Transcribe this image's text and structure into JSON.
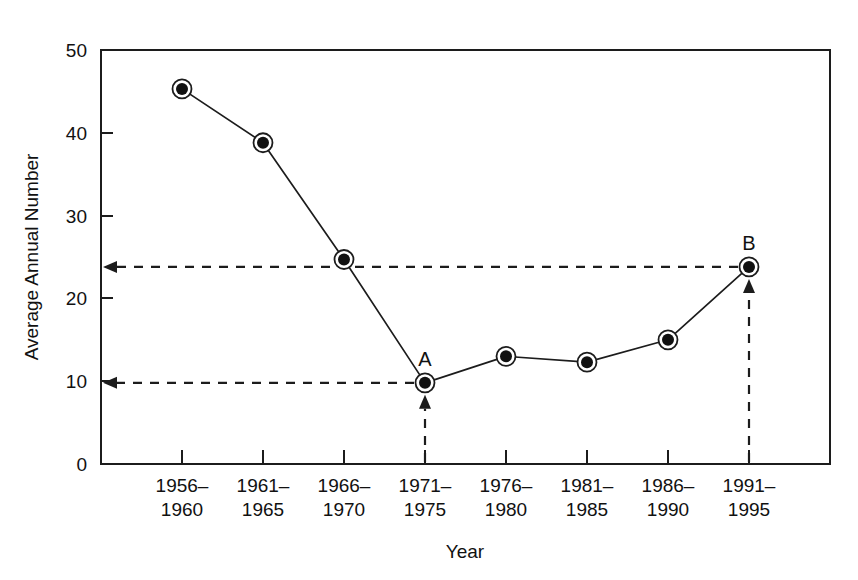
{
  "chart_data": {
    "type": "line",
    "title": "",
    "xlabel": "Year",
    "ylabel": "Average Annual Number",
    "categories": [
      "1956–1960",
      "1961–1965",
      "1966–1970",
      "1971–1975",
      "1976–1980",
      "1981–1985",
      "1986–1990",
      "1991–1995"
    ],
    "category_lines": [
      [
        "1956–",
        "1960"
      ],
      [
        "1961–",
        "1965"
      ],
      [
        "1966–",
        "1970"
      ],
      [
        "1971–",
        "1975"
      ],
      [
        "1976–",
        "1980"
      ],
      [
        "1981–",
        "1985"
      ],
      [
        "1986–",
        "1990"
      ],
      [
        "1991–",
        "1995"
      ]
    ],
    "values": [
      45.3,
      38.8,
      24.7,
      9.8,
      13.0,
      12.3,
      15.0,
      23.8
    ],
    "ylim": [
      0,
      50
    ],
    "yticks": [
      0,
      10,
      20,
      30,
      40,
      50
    ],
    "ytick_labels": [
      "0",
      "10",
      "20",
      "30",
      "40",
      "50"
    ],
    "grid": false,
    "legend": "none",
    "marker": "bullseye",
    "line_color": "#1c1c1c",
    "annotations": [
      {
        "label": "A",
        "category_index": 3,
        "value": 9.8,
        "guide_to_y_axis": true,
        "guide_from_below": true
      },
      {
        "label": "B",
        "category_index": 7,
        "value": 23.8,
        "guide_to_y_axis": true,
        "guide_from_below": true
      }
    ]
  },
  "axis_titles": {
    "x": "Year",
    "y": "Average Annual Number"
  },
  "colors": {
    "ink": "#1c1c1c",
    "background": "#ffffff",
    "marker_fill": "#111111"
  }
}
